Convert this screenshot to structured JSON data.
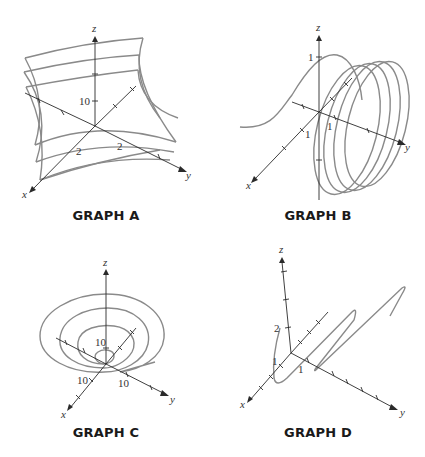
{
  "graphs": [
    {
      "id": "A",
      "caption": "GRAPH A",
      "axes": {
        "x": "x",
        "y": "y",
        "z": "z"
      },
      "tick_labels": {
        "z": "10",
        "x": "2",
        "y": "2"
      },
      "description": "saddle-like surface shown with wireframe curves"
    },
    {
      "id": "B",
      "caption": "GRAPH B",
      "axes": {
        "x": "x",
        "y": "y",
        "z": "z"
      },
      "tick_labels": {
        "z": "1",
        "x": "1",
        "y": "1"
      },
      "description": "helix-like space curve spiraling along y-axis"
    },
    {
      "id": "C",
      "caption": "GRAPH C",
      "axes": {
        "x": "x",
        "y": "y",
        "z": "z"
      },
      "tick_labels": {
        "z": "10",
        "x": "10",
        "y": "10"
      },
      "description": "spiral curve on a cone / paraboloid bowl"
    },
    {
      "id": "D",
      "caption": "GRAPH D",
      "axes": {
        "x": "x",
        "y": "y",
        "z": "z"
      },
      "tick_labels": {
        "z": "2",
        "x": "1",
        "y": "1"
      },
      "description": "zig-zag space curve growing along y"
    }
  ],
  "colors": {
    "curve": "#8a8a8a",
    "axis": "#2a2a2a",
    "text": "#1a1a1a"
  }
}
